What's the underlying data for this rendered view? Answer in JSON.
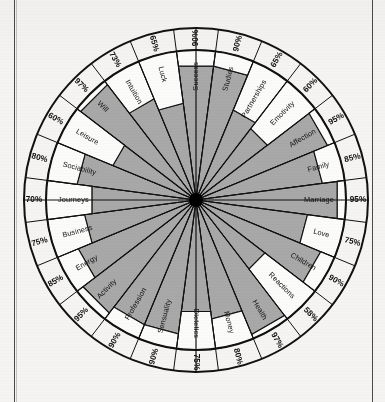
{
  "figure": {
    "type": "radar-wheel",
    "center": {
      "x": 196,
      "y": 200
    },
    "inner_radius": 150,
    "rim_outer_radius": 172,
    "hub_radius": 7,
    "sector_count": 28,
    "fill_color": "#a8a8a8",
    "empty_color": "#fbfbfa",
    "line_color": "#111111",
    "background_color": "#f5f4f2"
  },
  "chart_data": {
    "type": "radar",
    "title": "",
    "xlabel": "",
    "ylabel": "",
    "value_suffix": "%",
    "ylim": [
      0,
      100
    ],
    "grid": false,
    "legend": "none",
    "categories": [
      "Success",
      "Studies",
      "Partnerships",
      "Emotivity",
      "Affection",
      "Family",
      "Marriage",
      "Love",
      "Children",
      "Reactions",
      "Health",
      "Money",
      "Dietetics",
      "Sensuality",
      "Profession",
      "Activity",
      "Energy",
      "Business",
      "Journeys",
      "Sociability",
      "Leisure",
      "Will",
      "Intuition",
      "Luck"
    ],
    "values": [
      90,
      90,
      65,
      60,
      95,
      85,
      95,
      75,
      90,
      58,
      97,
      80,
      75,
      90,
      90,
      95,
      85,
      75,
      70,
      80,
      60,
      97,
      73,
      65
    ],
    "series": [
      {
        "name": "Level",
        "values": [
          90,
          90,
          65,
          60,
          95,
          85,
          95,
          75,
          90,
          58,
          97,
          80,
          75,
          90,
          90,
          95,
          85,
          75,
          70,
          80,
          60,
          97,
          73,
          65
        ]
      }
    ],
    "sectors": [
      {
        "label": "Success",
        "value": 90,
        "value_text": "90%"
      },
      {
        "label": "Studies",
        "value": 90,
        "value_text": "90%"
      },
      {
        "label": "Partnerships",
        "value": 65,
        "value_text": "65%"
      },
      {
        "label": "Emotivity",
        "value": 60,
        "value_text": "60%"
      },
      {
        "label": "Affection",
        "value": 95,
        "value_text": "95%"
      },
      {
        "label": "Family",
        "value": 85,
        "value_text": "85%"
      },
      {
        "label": "Marriage",
        "value": 95,
        "value_text": "95%"
      },
      {
        "label": "Love",
        "value": 75,
        "value_text": "75%"
      },
      {
        "label": "Children",
        "value": 90,
        "value_text": "90%"
      },
      {
        "label": "Reactions",
        "value": 58,
        "value_text": "58%"
      },
      {
        "label": "Health",
        "value": 97,
        "value_text": "97%"
      },
      {
        "label": "Money",
        "value": 80,
        "value_text": "80%"
      },
      {
        "label": "Dietetics",
        "value": 75,
        "value_text": "75%"
      },
      {
        "label": "Sensuality",
        "value": 90,
        "value_text": "90%"
      },
      {
        "label": "Profession",
        "value": 90,
        "value_text": "90%"
      },
      {
        "label": "Activity",
        "value": 95,
        "value_text": "95%"
      },
      {
        "label": "Energy",
        "value": 85,
        "value_text": "85%"
      },
      {
        "label": "Business",
        "value": 75,
        "value_text": "75%"
      },
      {
        "label": "Journeys",
        "value": 70,
        "value_text": "70%"
      },
      {
        "label": "Sociability",
        "value": 80,
        "value_text": "80%"
      },
      {
        "label": "Leisure",
        "value": 60,
        "value_text": "60%"
      },
      {
        "label": "Will",
        "value": 97,
        "value_text": "97%"
      },
      {
        "label": "Intuition",
        "value": 73,
        "value_text": "73%"
      },
      {
        "label": "Luck",
        "value": 65,
        "value_text": "65%"
      }
    ]
  }
}
